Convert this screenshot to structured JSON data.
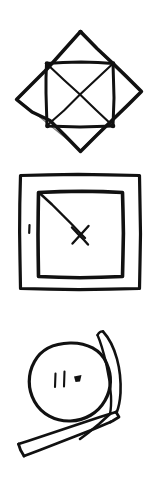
{
  "page": {
    "background_color": "#ffffff",
    "ink_color": "#111111",
    "width": 158,
    "height": 477,
    "figure_count": 3
  },
  "figures": [
    {
      "id": "figure-diamond-square",
      "name": "diamond-with-inscribed-square",
      "description": "Hand-drawn diamond (square rotated 45 degrees) containing an upright square whose corners touch the diamond edges, with both diagonals drawn inside the inner square forming an X",
      "caption": "Diamond with inscribed square and crossed diagonals",
      "strokes": [
        "diamond outline",
        "inner square outline",
        "diagonal top-left to bottom-right",
        "diagonal top-right to bottom-left"
      ]
    },
    {
      "id": "figure-nested-squares",
      "name": "nested-squares-with-diagonal",
      "description": "Hand-drawn square inside a larger square, with a diagonal line from the inner square's top-left corner to its center where a small X mark crosses it, and a short tick mark in the left margin between the squares",
      "caption": "Nested squares with diagonal and X mark",
      "strokes": [
        "outer square outline",
        "inner square outline",
        "diagonal from top-left corner to centre",
        "small crossing X mark at centre",
        "short tick mark at left margin"
      ]
    },
    {
      "id": "figure-circle-banner",
      "name": "circle-with-banner",
      "description": "Hand-drawn circle containing two short vertical strokes and a small solid blob, overlapped at upper-right and lower-left by a long narrow banner-like strip that sweeps diagonally across the circle",
      "caption": "Circle with interior marks overlaid by a diagonal banner strip",
      "strokes": [
        "circle outline",
        "two short vertical tick marks inside circle",
        "small solid blob inside circle",
        "narrow sliver at upper right",
        "long banner strip crossing lower left"
      ]
    }
  ]
}
